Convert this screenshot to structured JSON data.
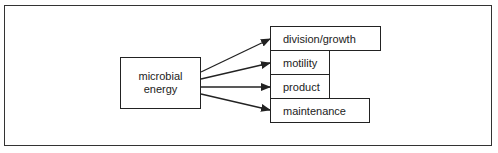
{
  "diagram": {
    "source": {
      "line1": "microbial",
      "line2": "energy"
    },
    "targets": [
      {
        "label": "division/growth"
      },
      {
        "label": "motility"
      },
      {
        "label": "product"
      },
      {
        "label": "maintenance"
      }
    ],
    "colors": {
      "line": "#222222",
      "background": "#ffffff"
    }
  }
}
